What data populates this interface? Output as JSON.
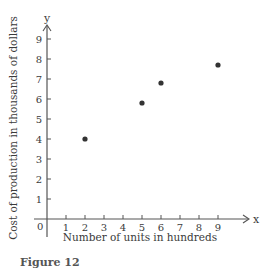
{
  "chart_data": {
    "type": "scatter",
    "title": "",
    "xlabel": "Number of units in hundreds",
    "ylabel": "Cost of production in thousands of dollars",
    "x_axis_name": "x",
    "y_axis_name": "y",
    "origin_label": "0",
    "x_ticks": [
      1,
      2,
      3,
      4,
      5,
      6,
      7,
      8,
      9
    ],
    "y_ticks": [
      1,
      2,
      3,
      4,
      5,
      6,
      7,
      8,
      9
    ],
    "xlim": [
      0,
      10
    ],
    "ylim": [
      0,
      10
    ],
    "grid": false,
    "points": [
      {
        "x": 2,
        "y": 4
      },
      {
        "x": 5,
        "y": 5.8
      },
      {
        "x": 6,
        "y": 6.8
      },
      {
        "x": 9,
        "y": 7.7
      }
    ]
  },
  "figure": {
    "caption": "Figure 12"
  }
}
